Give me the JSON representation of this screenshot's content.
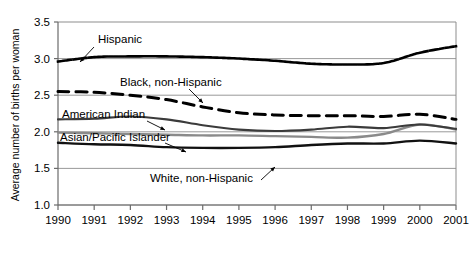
{
  "chart_data": {
    "type": "line",
    "title": "",
    "subtitle": "",
    "xlabel": "",
    "ylabel": "Average number of births per woman",
    "xlim": [
      1990,
      2001
    ],
    "ylim": [
      1.0,
      3.5
    ],
    "grid": true,
    "grid_axis": "y",
    "legend": "inline-annotations",
    "x": [
      1990,
      1991,
      1992,
      1993,
      1994,
      1995,
      1996,
      1997,
      1998,
      1999,
      2000,
      2001
    ],
    "xticks": [
      "1990",
      "1991",
      "1992",
      "1993",
      "1994",
      "1995",
      "1996",
      "1997",
      "1998",
      "1999",
      "2000",
      "2001"
    ],
    "yticks": [
      "1.0",
      "1.5",
      "2.0",
      "2.5",
      "3.0",
      "3.5"
    ],
    "ytick_values": [
      1.0,
      1.5,
      2.0,
      2.5,
      3.0,
      3.5
    ],
    "series": [
      {
        "name": "Hispanic",
        "label": "Hispanic",
        "style": "dotted",
        "color": "#000000",
        "width": 2.6,
        "values": [
          2.96,
          3.02,
          3.03,
          3.03,
          3.02,
          3.0,
          2.97,
          2.93,
          2.92,
          2.94,
          3.08,
          3.17
        ]
      },
      {
        "name": "Black, non-Hispanic",
        "label": "Black, non-Hispanic",
        "style": "dashed",
        "color": "#000000",
        "width": 3.0,
        "values": [
          2.55,
          2.54,
          2.5,
          2.44,
          2.34,
          2.26,
          2.23,
          2.22,
          2.22,
          2.21,
          2.24,
          2.17
        ]
      },
      {
        "name": "American Indian",
        "label": "American Indian",
        "style": "solid",
        "color": "#3b3b3b",
        "width": 2.1,
        "values": [
          2.17,
          2.18,
          2.21,
          2.17,
          2.09,
          2.03,
          2.01,
          2.03,
          2.07,
          2.05,
          2.1,
          2.04
        ]
      },
      {
        "name": "Asian/Pacific Islander",
        "label": "Asian/Pacific Islander",
        "style": "solid",
        "color": "#8a8a8a",
        "width": 2.3,
        "values": [
          1.99,
          1.98,
          1.97,
          1.96,
          1.95,
          1.95,
          1.94,
          1.93,
          1.92,
          1.97,
          2.1,
          2.03
        ]
      },
      {
        "name": "White, non-Hispanic",
        "label": "White, non-Hispanic",
        "style": "solid",
        "color": "#111111",
        "width": 2.4,
        "values": [
          1.85,
          1.83,
          1.82,
          1.79,
          1.78,
          1.78,
          1.79,
          1.82,
          1.84,
          1.84,
          1.88,
          1.84
        ]
      }
    ],
    "annotations": [
      {
        "name": "hispanic-label",
        "text": "Hispanic",
        "x": 98,
        "y": 43,
        "leader": [
          94,
          47,
          80,
          62
        ]
      },
      {
        "name": "black-non-hispanic-label",
        "text": "Black, non-Hispanic",
        "x": 120,
        "y": 86,
        "leader": [
          189,
          89,
          203,
          103
        ]
      },
      {
        "name": "american-indian-label",
        "text": "American Indian",
        "x": 62,
        "y": 118,
        "leader": [
          147,
          121,
          165,
          130
        ]
      },
      {
        "name": "asian-pacific-islander-label",
        "text": "Asian/Pacific Islander",
        "x": 60,
        "y": 141,
        "leader": [
          165,
          143,
          186,
          152
        ]
      },
      {
        "name": "white-non-hispanic-label",
        "text": "White, non-Hispanic",
        "x": 150,
        "y": 182,
        "leader": [
          261,
          180,
          275,
          167
        ]
      }
    ]
  }
}
